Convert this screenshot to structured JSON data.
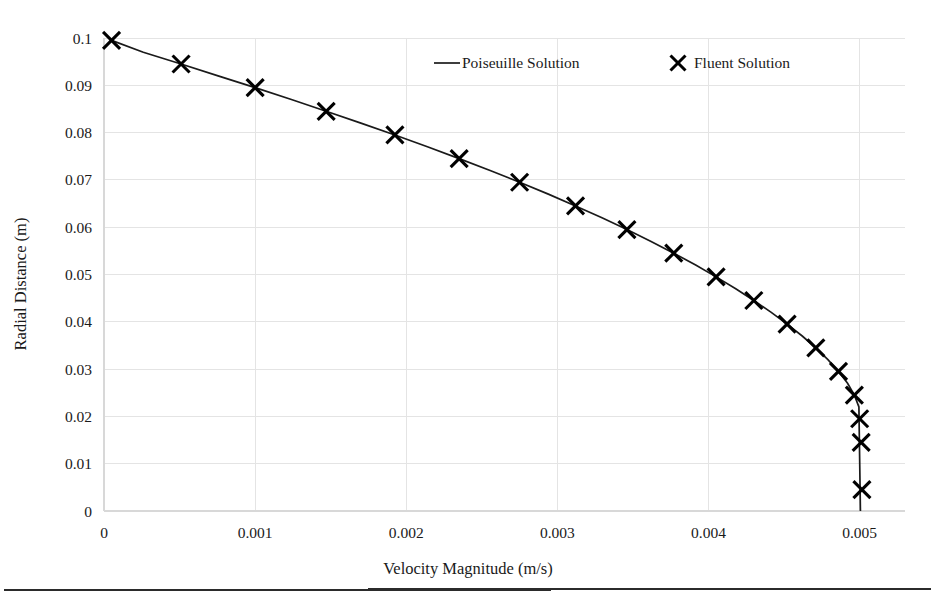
{
  "chart_data": {
    "type": "line",
    "title": "",
    "xlabel": "Velocity Magnitude (m/s)",
    "ylabel": "Radial Distance (m)",
    "xlim": [
      0,
      0.0053
    ],
    "ylim": [
      0,
      0.1
    ],
    "grid": true,
    "legend_position": "top-center-right",
    "xticks": [
      0,
      0.001,
      0.002,
      0.003,
      0.004,
      0.005
    ],
    "xtick_labels": [
      "0",
      "0.001",
      "0.002",
      "0.003",
      "0.004",
      "0.005"
    ],
    "yticks": [
      0,
      0.01,
      0.02,
      0.03,
      0.04,
      0.05,
      0.06,
      0.07,
      0.08,
      0.09,
      0.1
    ],
    "ytick_labels": [
      "0",
      "0.01",
      "0.02",
      "0.03",
      "0.04",
      "0.05",
      "0.06",
      "0.07",
      "0.08",
      "0.09",
      "0.1"
    ],
    "series": [
      {
        "name": "Poiseuille Solution",
        "marker": "none",
        "style": "line",
        "color": "#1a1a1a",
        "x": [
          5e-05,
          0.00026,
          0.00051,
          0.000755,
          0.001,
          0.00124,
          0.00147,
          0.0017,
          0.001925,
          0.00214,
          0.00235,
          0.002555,
          0.00275,
          0.00294,
          0.00312,
          0.003295,
          0.00346,
          0.00362,
          0.00377,
          0.003915,
          0.00405,
          0.00418,
          0.0043,
          0.004415,
          0.00452,
          0.00462,
          0.00471,
          0.00479,
          0.00486,
          0.00492,
          0.004965,
          0.004995,
          0.005005
        ],
        "y": [
          0.0995,
          0.097,
          0.0945,
          0.092,
          0.0895,
          0.087,
          0.0845,
          0.082,
          0.0795,
          0.077,
          0.0745,
          0.072,
          0.0695,
          0.067,
          0.0645,
          0.062,
          0.0595,
          0.057,
          0.0545,
          0.052,
          0.0495,
          0.047,
          0.0445,
          0.042,
          0.0395,
          0.037,
          0.0345,
          0.032,
          0.0295,
          0.027,
          0.0245,
          0.022,
          0.0
        ]
      },
      {
        "name": "Fluent Solution",
        "marker": "x",
        "style": "markers",
        "color": "#000000",
        "x": [
          5e-05,
          0.00051,
          0.001,
          0.00147,
          0.001925,
          0.00235,
          0.00275,
          0.00312,
          0.00346,
          0.00377,
          0.00405,
          0.0043,
          0.00452,
          0.00471,
          0.00486,
          0.004965,
          0.005,
          0.00501,
          0.005015
        ],
        "y": [
          0.0995,
          0.0945,
          0.0895,
          0.0845,
          0.0795,
          0.0745,
          0.0695,
          0.0645,
          0.0595,
          0.0545,
          0.0495,
          0.0445,
          0.0395,
          0.0345,
          0.0295,
          0.0245,
          0.0195,
          0.0145,
          0.0045
        ]
      }
    ],
    "legend": [
      {
        "label": "Poiseuille Solution",
        "symbol": "line"
      },
      {
        "label": "Fluent Solution",
        "symbol": "x-marker"
      }
    ],
    "colors": {
      "series": "#1a1a1a",
      "grid": "#e4e4e4",
      "axis": "#d8d8d8",
      "text": "#1a1a1a",
      "background": "#ffffff"
    }
  }
}
